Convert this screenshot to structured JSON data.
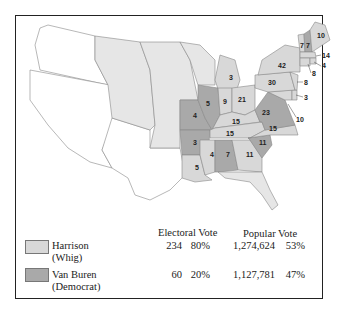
{
  "colors": {
    "whig": "#d8d8d8",
    "democrat": "#a9a9a9",
    "territory": "#e6e6e6",
    "unorganized": "#ffffff",
    "border": "#888888",
    "frame": "#222222"
  },
  "legend": {
    "electoral_header": "Electoral Vote",
    "popular_header": "Popular Vote",
    "candidates": [
      {
        "name": "Harrison",
        "party": "(Whig)",
        "electoral": "234",
        "electoral_pct": "80%",
        "popular": "1,274,624",
        "popular_pct": "53%"
      },
      {
        "name": "Van Buren",
        "party": "(Democrat)",
        "electoral": "60",
        "electoral_pct": "20%",
        "popular": "1,127,781",
        "popular_pct": "47%"
      }
    ]
  },
  "states": {
    "ME": "10",
    "NH": "7",
    "VT": "7",
    "MA": "14",
    "RI": "4",
    "CT": "8",
    "NY": "42",
    "NJ": "8",
    "DE": "3",
    "MD": "10",
    "PA": "30",
    "VA": "23",
    "NC": "15",
    "SC": "11",
    "GA": "11",
    "AL": "7",
    "MS": "4",
    "LA": "5",
    "AR": "3",
    "MO": "4",
    "IL": "5",
    "IN": "9",
    "OH": "21",
    "MI": "3",
    "KY": "15",
    "TN": "15"
  }
}
